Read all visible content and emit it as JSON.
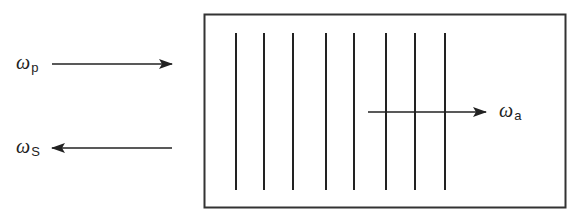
{
  "diagram": {
    "type": "four-wave mixing / grating interaction schematic",
    "box": {
      "x": 204,
      "y": 14,
      "width": 362,
      "height": 194,
      "stroke": "#333333"
    },
    "grating_lines": {
      "x": [
        236,
        264,
        293,
        326,
        354,
        386,
        415,
        445
      ],
      "y_top": 33,
      "y_bottom": 190,
      "stroke": "#222222"
    },
    "arrows": [
      {
        "id": "pump",
        "from": [
          52,
          64
        ],
        "to": [
          172,
          64
        ],
        "direction": "right"
      },
      {
        "id": "stokes",
        "from": [
          172,
          148
        ],
        "to": [
          52,
          148
        ],
        "direction": "left"
      },
      {
        "id": "anti-stokes",
        "from": [
          368,
          112
        ],
        "to": [
          486,
          112
        ],
        "direction": "right"
      }
    ],
    "labels": {
      "pump": {
        "symbol": "ω",
        "subscript": "p"
      },
      "stokes": {
        "symbol": "ω",
        "subscript": "S"
      },
      "anti_stokes": {
        "symbol": "ω",
        "subscript": "a"
      }
    }
  }
}
